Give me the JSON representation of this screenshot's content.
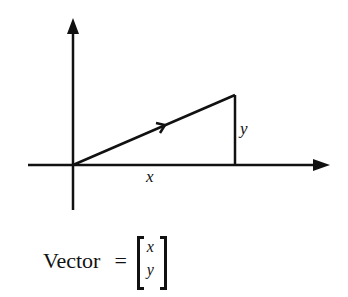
{
  "diagram": {
    "labels": {
      "x": "x",
      "y": "y"
    },
    "vector": {
      "origin": [
        73,
        165
      ],
      "tip": [
        235,
        95
      ]
    },
    "color": "#111111"
  },
  "formula": {
    "lhs": "Vector",
    "equals": "=",
    "components": [
      "x",
      "y"
    ]
  }
}
